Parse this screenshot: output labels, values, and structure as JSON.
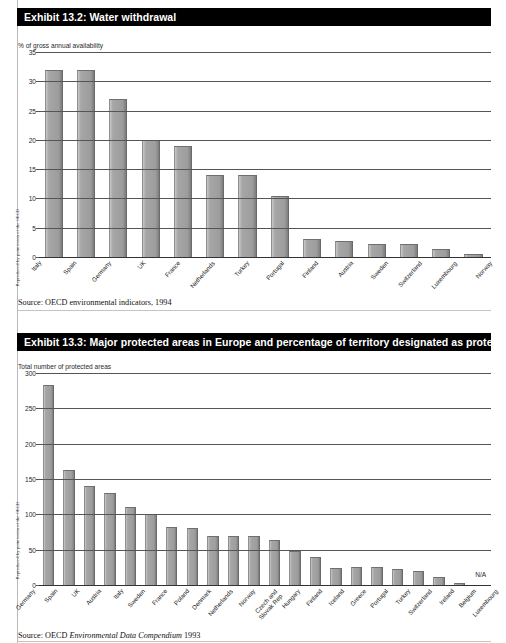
{
  "margin_credits": [
    "Reproduced by permission of the OECD",
    "Reproduced by permission of the OECD"
  ],
  "exhibits": [
    {
      "title": "Exhibit 13.2: Water withdrawal",
      "source_prefix": "Source:  OECD environmental indicators, 1994",
      "source_italic": "",
      "source_suffix": ""
    },
    {
      "title": "Exhibit 13.3: Major protected areas in Europe and percentage of territory designated as protected",
      "source_prefix": "Source: OECD ",
      "source_italic": "Environmental Data Compendium",
      "source_suffix": " 1993"
    }
  ],
  "chart_data": [
    {
      "type": "bar",
      "title": "Exhibit 13.2: Water withdrawal",
      "ylabel": "% of gross annual availability",
      "xlabel": "",
      "ylim": [
        0,
        35
      ],
      "yticks": [
        0,
        5,
        10,
        15,
        20,
        25,
        30,
        35
      ],
      "grid": true,
      "legend": "none",
      "bar_color": "#a0a0a0",
      "categories": [
        "Italy",
        "Spain",
        "Germany",
        "UK",
        "France",
        "Netherlands",
        "Turkey",
        "Portugal",
        "Finland",
        "Austria",
        "Sweden",
        "Switzerland",
        "Luxembourg",
        "Norway"
      ],
      "values": [
        32,
        32,
        27,
        20,
        19,
        14,
        14,
        10.5,
        3,
        2.7,
        2.2,
        2.2,
        1.4,
        0.6
      ]
    },
    {
      "type": "bar",
      "title": "Exhibit 13.3: Major protected areas in Europe and percentage of territory designated as protected",
      "ylabel": "Total number of protected areas",
      "xlabel": "",
      "ylim": [
        0,
        300
      ],
      "yticks": [
        0,
        50,
        100,
        150,
        200,
        250,
        300
      ],
      "grid": true,
      "legend": "none",
      "bar_color": "#a0a0a0",
      "categories": [
        "Germany",
        "Spain",
        "UK",
        "Austria",
        "Italy",
        "Sweden",
        "France",
        "Poland",
        "Denmark",
        "Netherlands",
        "Norway",
        "Czech and Slovak Rep",
        "Hungary",
        "Finland",
        "Iceland",
        "Greece",
        "Portugal",
        "Turkey",
        "Switzerland",
        "Ireland",
        "Belgium",
        "Luxembourg"
      ],
      "values": [
        283,
        163,
        140,
        130,
        110,
        101,
        82,
        80,
        69,
        69,
        69,
        63,
        48,
        39,
        24,
        26,
        25,
        22,
        20,
        12,
        3,
        null
      ],
      "annotations": [
        {
          "category": "Luxembourg",
          "text": "N/A"
        }
      ]
    }
  ]
}
